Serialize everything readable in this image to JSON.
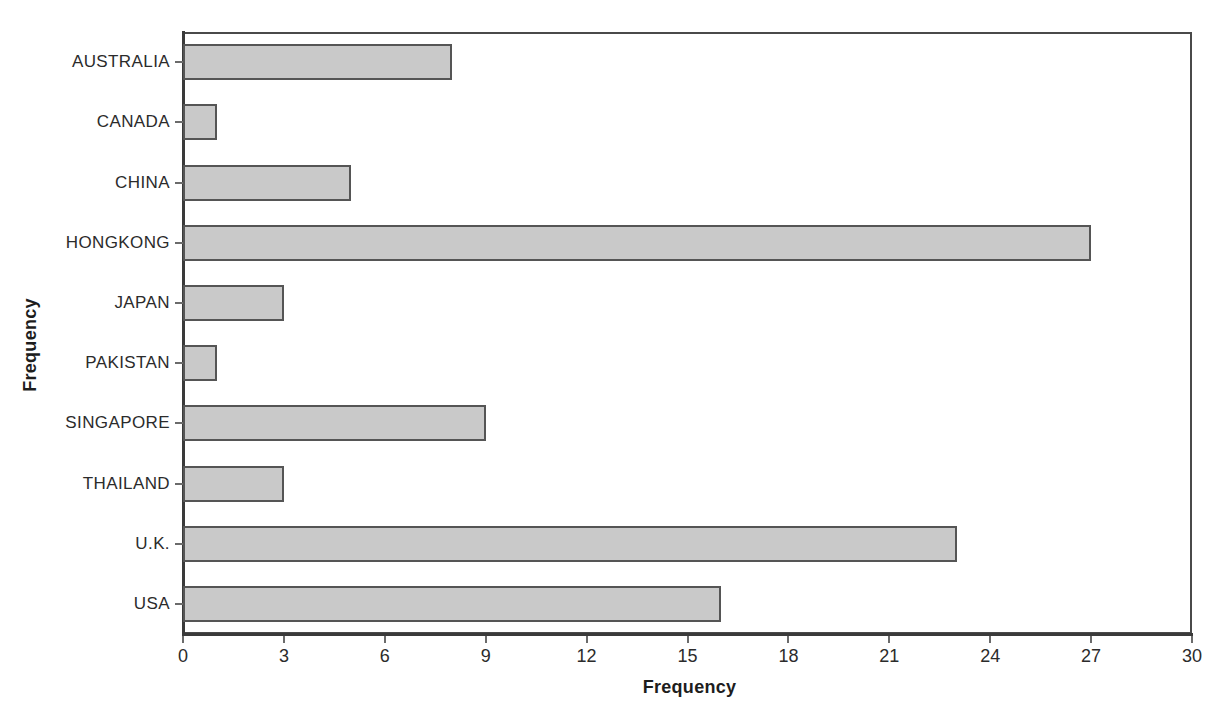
{
  "chart_data": {
    "type": "bar",
    "orientation": "horizontal",
    "title": "",
    "xlabel": "Frequency",
    "ylabel": "Frequency",
    "categories": [
      "AUSTRALIA",
      "CANADA",
      "CHINA",
      "HONGKONG",
      "JAPAN",
      "PAKISTAN",
      "SINGAPORE",
      "THAILAND",
      "U.K.",
      "USA"
    ],
    "values": [
      8,
      1,
      5,
      27,
      3,
      1,
      9,
      3,
      23,
      16
    ],
    "xlim": [
      0,
      30
    ],
    "xticks": [
      0,
      3,
      6,
      9,
      12,
      15,
      18,
      21,
      24,
      27,
      30
    ],
    "xtick_labels": [
      "0",
      "3",
      "6",
      "9",
      "12",
      "15",
      "18",
      "21",
      "24",
      "27",
      "30"
    ],
    "grid": true,
    "legend": null,
    "bar_fill_color": "#c9c9c9",
    "bar_edge_color": "#555555",
    "axis_color": "#4a4a4a",
    "grid_color": "#f2f2f2",
    "background_color": "#ffffff"
  }
}
